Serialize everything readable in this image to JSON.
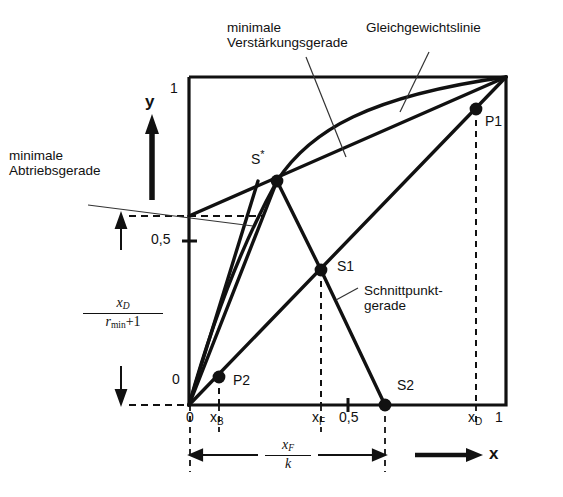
{
  "figure": {
    "kind": "mccabe-thiele-diagram",
    "axes": {
      "x_axis_label": "x",
      "y_axis_label": "y",
      "x_ticks": [
        {
          "label": "0",
          "value": 0
        },
        {
          "label": "x",
          "sub": "B",
          "value": 0.09
        },
        {
          "label": "x",
          "sub": "F",
          "value": 0.41
        },
        {
          "label": "0,5",
          "value": 0.5
        },
        {
          "label": "x",
          "sub": "D",
          "value": 0.905
        },
        {
          "label": "1",
          "value": 1
        }
      ],
      "y_ticks": [
        {
          "label": "0",
          "value": 0
        },
        {
          "label": "0,5",
          "value": 0.5
        },
        {
          "label": "1",
          "value": 1
        }
      ],
      "xlim": [
        0,
        1
      ],
      "ylim": [
        0,
        1
      ]
    },
    "annotations": {
      "min_rectifying": "minimale\nVerstärkungsgerade",
      "min_rectifying_line1": "minimale",
      "min_rectifying_line2": "Verstärkungsgerade",
      "equilibrium": "Gleichgewichtslinie",
      "min_stripping_line1": "minimale",
      "min_stripping_line2": "Abtriebsgerade",
      "intersection_line1": "Schnittpunkt-",
      "intersection_line2": "gerade"
    },
    "points": [
      {
        "name": "S*",
        "label": "S",
        "superscript": "*",
        "x": 0.277,
        "y": 0.683
      },
      {
        "name": "P1",
        "label": "P1",
        "x": 0.905,
        "y": 0.902
      },
      {
        "name": "P2",
        "label": "P2",
        "x": 0.093,
        "y": 0.085
      },
      {
        "name": "S1",
        "label": "S1",
        "x": 0.414,
        "y": 0.412
      },
      {
        "name": "S2",
        "label": "S2",
        "x": 0.617,
        "y": 0.0
      }
    ],
    "measures": {
      "y_intercept_fraction": {
        "numerator": "x_D",
        "denominator": "r_min + 1",
        "num_base": "x",
        "num_sub": "D",
        "den_base": "r",
        "den_sub": "min",
        "den_tail": "+1"
      },
      "x_span_fraction": {
        "numerator": "x_F",
        "denominator": "k",
        "num_base": "x",
        "num_sub": "F",
        "den_base": "k"
      }
    },
    "colors": {
      "line": "#111111",
      "thin_line": "#444444",
      "background": "#ffffff"
    }
  }
}
